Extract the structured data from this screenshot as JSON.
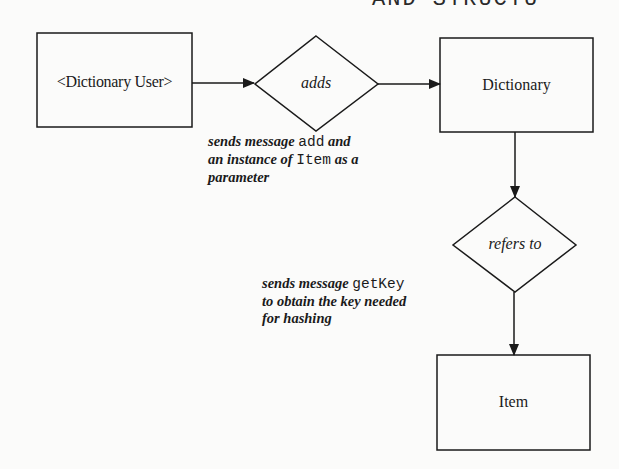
{
  "header": {
    "fragment": "AND STRUCTU"
  },
  "nodes": {
    "dictionary_user": {
      "label": "<Dictionary User>"
    },
    "adds": {
      "label": "adds"
    },
    "dictionary": {
      "label": "Dictionary"
    },
    "refers_to": {
      "label": "refers to"
    },
    "item": {
      "label": "Item"
    }
  },
  "captions": {
    "adds_note": {
      "line1_a": "sends message ",
      "line1_code": "add",
      "line1_b": " and",
      "line2_a": "an instance of ",
      "line2_code": "Item",
      "line2_b": " as a",
      "line3": "parameter"
    },
    "refers_note": {
      "line1_a": "sends message ",
      "line1_code": "getKey",
      "line2": "to obtain the key needed",
      "line3": "for hashing"
    }
  },
  "colors": {
    "stroke": "#1a1a1a",
    "background": "#fbfbfa"
  }
}
